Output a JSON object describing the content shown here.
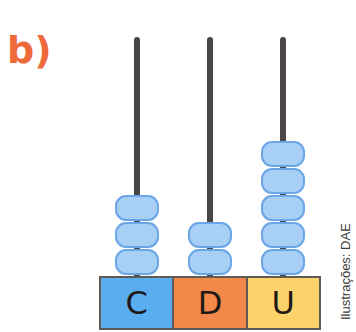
{
  "label": {
    "text": "b)",
    "color": "#ef6a3a"
  },
  "abacus": {
    "rod_color": "#4a4546",
    "bead_color": "#a8cff5",
    "columns": [
      {
        "name": "C",
        "beads": 3,
        "color": "#5aaef0"
      },
      {
        "name": "D",
        "beads": 2,
        "color": "#f2894a"
      },
      {
        "name": "U",
        "beads": 5,
        "color": "#fcd36b"
      }
    ]
  },
  "credit": "Ilustrações: DAE"
}
